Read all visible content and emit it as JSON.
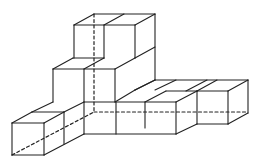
{
  "figure": {
    "stroke_color": "#222222",
    "background": "#ffffff",
    "solid_edges": [
      [
        74,
        25,
        135,
        25
      ],
      [
        74,
        25,
        94,
        14
      ],
      [
        94,
        14,
        155,
        14
      ],
      [
        104,
        25,
        124,
        14
      ],
      [
        135,
        25,
        155,
        14
      ],
      [
        74,
        25,
        74,
        58
      ],
      [
        104,
        25,
        104,
        58
      ],
      [
        135,
        25,
        135,
        58
      ],
      [
        155,
        14,
        155,
        80
      ],
      [
        135,
        58,
        155,
        47
      ],
      [
        135,
        90,
        155,
        80
      ],
      [
        53,
        69,
        115,
        69
      ],
      [
        53,
        69,
        73,
        58
      ],
      [
        73,
        58,
        104,
        58
      ],
      [
        84,
        69,
        104,
        58
      ],
      [
        115,
        69,
        135,
        58
      ],
      [
        53,
        69,
        53,
        102
      ],
      [
        84,
        69,
        84,
        102
      ],
      [
        115,
        69,
        115,
        102
      ],
      [
        12,
        123,
        44,
        123
      ],
      [
        12,
        123,
        32,
        112
      ],
      [
        32,
        112,
        64,
        112
      ],
      [
        44,
        123,
        64,
        112
      ],
      [
        32,
        112,
        53,
        102
      ],
      [
        64,
        112,
        84,
        102
      ],
      [
        12,
        123,
        12,
        155
      ],
      [
        44,
        123,
        44,
        155
      ],
      [
        64,
        112,
        64,
        144
      ],
      [
        84,
        102,
        84,
        134
      ],
      [
        12,
        155,
        44,
        155
      ],
      [
        44,
        155,
        84,
        134
      ],
      [
        84,
        134,
        176,
        134
      ],
      [
        84,
        102,
        176,
        102
      ],
      [
        115,
        102,
        135,
        90
      ],
      [
        116,
        102,
        116,
        134
      ],
      [
        145,
        102,
        145,
        128
      ],
      [
        176,
        102,
        176,
        134
      ],
      [
        176,
        134,
        197,
        124
      ],
      [
        135,
        90,
        155,
        80
      ],
      [
        155,
        80,
        248,
        80
      ],
      [
        155,
        90,
        176,
        80
      ],
      [
        176,
        102,
        197,
        91
      ],
      [
        197,
        91,
        197,
        124
      ],
      [
        145,
        102,
        166,
        91
      ],
      [
        166,
        91,
        197,
        91
      ],
      [
        186,
        91,
        207,
        80
      ],
      [
        217,
        80,
        197,
        91
      ],
      [
        197,
        91,
        228,
        91
      ],
      [
        228,
        91,
        248,
        80
      ],
      [
        228,
        91,
        228,
        124
      ],
      [
        248,
        80,
        248,
        113
      ],
      [
        228,
        124,
        248,
        113
      ],
      [
        197,
        124,
        228,
        124
      ]
    ],
    "dashed_edges": [
      [
        94,
        14,
        94,
        112
      ],
      [
        94,
        112,
        248,
        112
      ],
      [
        12,
        155,
        94,
        112
      ]
    ]
  }
}
